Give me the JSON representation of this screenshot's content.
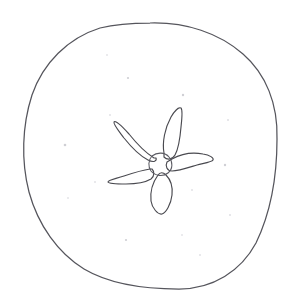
{
  "artwork": {
    "title": "Hand-drawn flower line sketch",
    "medium": "scanned pencil line drawing",
    "canvas": {
      "width": 303,
      "height": 302,
      "background_color": "#ffffff"
    },
    "ink_color": "#4a4a50",
    "outline_color": "#55555c",
    "speck_color": "#cfcfd4"
  },
  "shapes": {
    "outer_circle": {
      "name": "hand-drawn circle outline",
      "bounds": {
        "left": 23,
        "top": 22,
        "right": 277,
        "bottom": 289
      },
      "center": {
        "x": 150,
        "y": 156
      },
      "radius_x": 127,
      "radius_y": 134,
      "path": "M 150 23 C 186 22 219 33 243 54 C 266 74 278 104 277 139 C 277 176 271 212 256 243 C 241 271 213 289 179 289 C 145 289 111 285 84 269 C 58 253 38 225 29 192 C 21 161 22 126 32 95 C 43 63 68 38 100 28 C 116 24 133 23 150 23 Z"
    },
    "flower": {
      "name": "five-petal flower",
      "petal_count": 5,
      "center": {
        "x": 160,
        "y": 163
      },
      "center_circle_radius": 10,
      "center_path": "M 152 156 C 157 152 165 152 169 157 C 173 162 173 169 168 173 C 163 177 155 176 151 171 C 148 167 148 160 152 156 Z",
      "petals": [
        {
          "name": "petal-top-right",
          "direction": "up-right",
          "tip": {
            "x": 180,
            "y": 107
          },
          "path": "M 164 153 C 162 142 165 128 171 117 C 175 110 179 107 181 108 C 183 110 182 118 181 127 C 180 139 179 148 175 155 C 172 160 167 160 164 157 Z"
        },
        {
          "name": "petal-upper-left",
          "direction": "up-left",
          "tip": {
            "x": 115,
            "y": 119
          },
          "path": "M 154 158 C 146 153 137 144 129 134 C 121 125 115 120 114 122 C 113 124 118 130 124 138 C 132 148 140 156 148 160 C 154 163 157 161 156 158 Z"
        },
        {
          "name": "petal-right",
          "direction": "right",
          "tip": {
            "x": 212,
            "y": 160
          },
          "path": "M 172 159 C 181 154 193 152 203 154 C 210 155 214 158 213 160 C 212 162 205 163 197 165 C 187 168 178 171 172 171 C 167 171 165 166 167 162 Z"
        },
        {
          "name": "petal-lower-left",
          "direction": "left-down",
          "tip": {
            "x": 108,
            "y": 180
          },
          "path": "M 150 169 C 143 170 133 173 124 176 C 115 179 108 180 108 182 C 109 184 117 184 126 184 C 137 184 146 182 151 179 C 155 176 154 171 152 169 Z"
        },
        {
          "name": "petal-bottom",
          "direction": "down",
          "tip": {
            "x": 162,
            "y": 214
          },
          "path": "M 158 175 C 153 182 150 192 151 201 C 152 208 158 215 162 214 C 166 213 171 204 172 195 C 173 186 170 179 166 175 C 163 172 160 172 158 175 Z"
        }
      ]
    },
    "specks": [
      {
        "x": 128,
        "y": 78,
        "r": 1.1,
        "faint": false
      },
      {
        "x": 183,
        "y": 95,
        "r": 1.2,
        "faint": false
      },
      {
        "x": 110,
        "y": 115,
        "r": 1.0,
        "faint": true
      },
      {
        "x": 65,
        "y": 145,
        "r": 1.3,
        "faint": false
      },
      {
        "x": 228,
        "y": 120,
        "r": 1.1,
        "faint": true
      },
      {
        "x": 225,
        "y": 165,
        "r": 1.2,
        "faint": false
      },
      {
        "x": 95,
        "y": 182,
        "r": 1.0,
        "faint": true
      },
      {
        "x": 68,
        "y": 198,
        "r": 0.9,
        "faint": true
      },
      {
        "x": 192,
        "y": 190,
        "r": 1.0,
        "faint": true
      },
      {
        "x": 230,
        "y": 215,
        "r": 1.1,
        "faint": true
      },
      {
        "x": 126,
        "y": 240,
        "r": 1.1,
        "faint": false
      },
      {
        "x": 182,
        "y": 235,
        "r": 0.9,
        "faint": true
      },
      {
        "x": 107,
        "y": 55,
        "r": 0.9,
        "faint": true
      },
      {
        "x": 200,
        "y": 255,
        "r": 1.0,
        "faint": true
      }
    ]
  }
}
